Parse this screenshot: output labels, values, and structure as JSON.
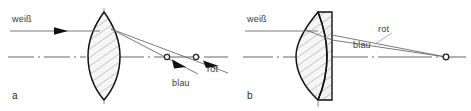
{
  "figure": {
    "width": 471,
    "height": 111,
    "background": "#ffffff",
    "ink": "#1a1a1a",
    "ray_color": "#6b6b6b",
    "axis_color": "#555555",
    "hatch_color": "#9a9a9a",
    "glass_fill": "#f4f4f4"
  },
  "panels": [
    {
      "id": "a",
      "caption": "a",
      "subject": "single biconvex lens with chromatic aberration",
      "incoming_label": "weiß",
      "incoming_has_arrowhead": true,
      "focus_labels": [
        {
          "text": "blau",
          "color_name": "blue"
        },
        {
          "text": "rot",
          "color_name": "red"
        }
      ],
      "focus_count": 2
    },
    {
      "id": "b",
      "caption": "b",
      "subject": "achromatic doublet, both colours share one focus",
      "incoming_label": "weiß",
      "incoming_has_arrowhead": false,
      "focus_labels": [
        {
          "text": "rot",
          "color_name": "red"
        },
        {
          "text": "blau",
          "color_name": "blue"
        }
      ],
      "focus_count": 1
    }
  ],
  "labels": {
    "a_weiss": "weiß",
    "a_blau": "blau",
    "a_rot": "rot",
    "a_caption": "a",
    "b_weiss": "weiß",
    "b_rot": "rot",
    "b_blau": "blau",
    "b_caption": "b"
  }
}
